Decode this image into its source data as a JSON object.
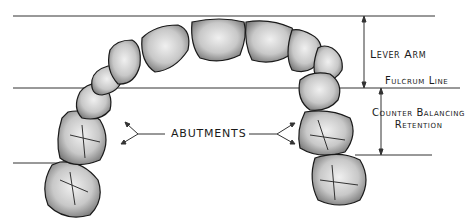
{
  "figure": {
    "type": "dental arch lever diagram",
    "reference_lines": [
      {
        "id": "top-line",
        "y": 16
      },
      {
        "id": "fulcrum-line",
        "y": 88
      },
      {
        "id": "bottom-line",
        "y": 163
      }
    ]
  },
  "labels": {
    "lever_arm": "Lever Arm",
    "fulcrum_line": "Fulcrum Line",
    "counter_balancing_line1": "Counter Balancing",
    "counter_balancing_line2": "Retention",
    "abutments": "ABUTMENTS"
  },
  "colors": {
    "line": "#333333",
    "tooth_fill": "#d9d9d9",
    "tooth_shadow": "#8a8a8a",
    "outline": "#1a1a1a"
  }
}
